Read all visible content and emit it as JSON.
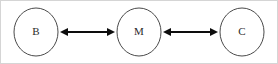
{
  "figure": {
    "type": "node-link-diagram",
    "background_color": "#ffffff",
    "frame_color": "#d5d5d5",
    "node_stroke_color": "#4a4a4a",
    "node_fill_color": "#ffffff",
    "edge_color": "#0d0d0d",
    "label_color": "#2a2a2a"
  },
  "nodes": [
    {
      "id": "B",
      "label": "B",
      "cx": 36,
      "cy": 32,
      "rx": 22,
      "ry": 24
    },
    {
      "id": "M",
      "label": "M",
      "cx": 139,
      "cy": 32,
      "rx": 22,
      "ry": 24
    },
    {
      "id": "C",
      "label": "C",
      "cx": 242,
      "cy": 32,
      "rx": 22,
      "ry": 24
    }
  ],
  "edges": [
    {
      "id": "edge-b-m",
      "source": "B",
      "target": "M",
      "direction": "bidirectional",
      "label": "",
      "x1": 60,
      "x2": 115,
      "y": 32
    },
    {
      "id": "edge-m-c",
      "source": "M",
      "target": "C",
      "direction": "bidirectional",
      "label": "",
      "x1": 163,
      "x2": 218,
      "y": 32
    }
  ]
}
